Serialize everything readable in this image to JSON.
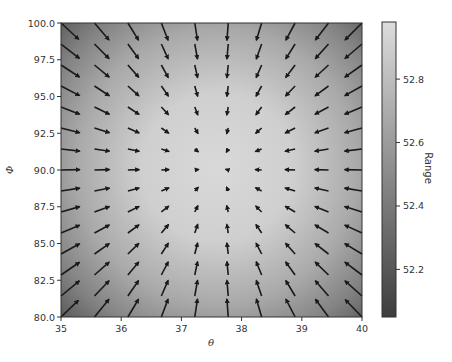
{
  "chart_data": {
    "type": "quiver+heatmap",
    "title": "",
    "xlabel": "θ",
    "ylabel": "Φ",
    "xlim": [
      35,
      40
    ],
    "ylim": [
      80,
      100
    ],
    "xticks": [
      "35",
      "36",
      "37",
      "38",
      "39",
      "40"
    ],
    "yticks": [
      "80.0",
      "82.5",
      "85.0",
      "87.5",
      "90.0",
      "92.5",
      "95.0",
      "97.5",
      "100.0"
    ],
    "grid": false,
    "heatmap": {
      "colormap": "gray",
      "peak": {
        "theta": 37.6,
        "phi": 90.2
      },
      "value_range": [
        52.05,
        52.98
      ]
    },
    "quiver": {
      "columns": 10,
      "rows": 15,
      "x": [
        35.0,
        35.556,
        36.111,
        36.667,
        37.222,
        37.778,
        38.333,
        38.889,
        39.444,
        40.0
      ],
      "y": [
        80.0,
        81.429,
        82.857,
        84.286,
        85.714,
        87.143,
        88.571,
        90.0,
        91.429,
        92.857,
        94.286,
        95.714,
        97.143,
        98.571,
        100.0
      ],
      "direction": "toward peak (gradient of Range)",
      "color": "#1a1a1a"
    },
    "colorbar": {
      "label": "Range",
      "ticks": [
        "52.2",
        "52.4",
        "52.6",
        "52.8"
      ],
      "tick_values": [
        52.2,
        52.4,
        52.6,
        52.8
      ],
      "min": 52.05,
      "max": 52.98
    }
  }
}
